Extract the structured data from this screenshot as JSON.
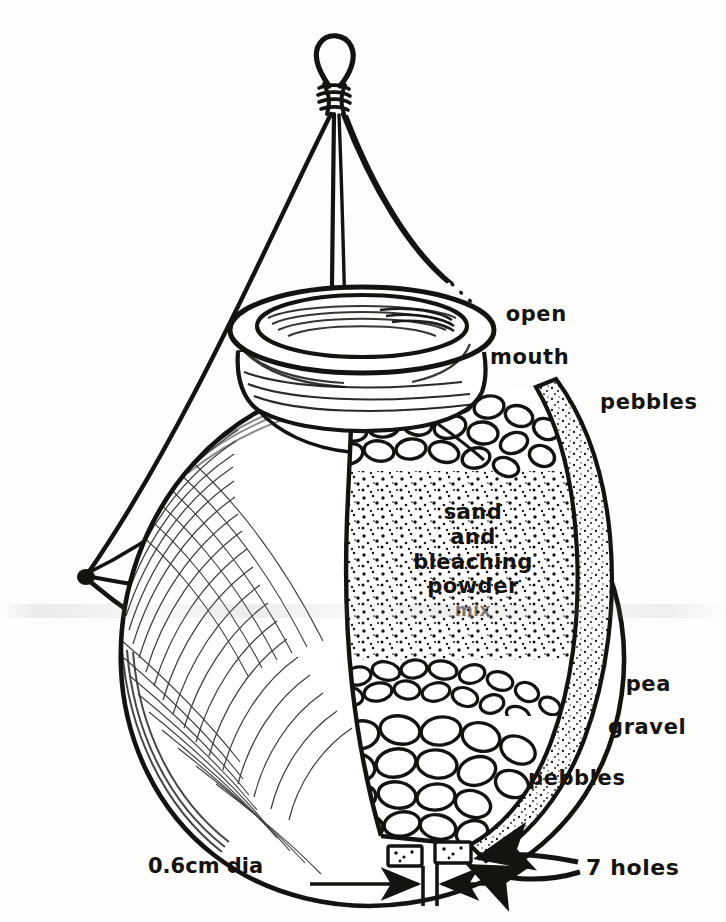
{
  "figure": {
    "ink_color": "#15130f",
    "paper_color": "#fdfdfc"
  },
  "labels": {
    "open_mouth_line1": "open",
    "open_mouth_line2": "mouth",
    "pebbles_top": "pebbles",
    "pea_gravel_line1": "pea",
    "pea_gravel_line2": "gravel",
    "pebbles_bottom": "pebbles",
    "holes": "7 holes",
    "hole_diameter": "0.6cm dia"
  },
  "fill_label": {
    "line1": "sand",
    "line2": "and",
    "line3": "bleaching",
    "line4": "powder",
    "line5": "mix"
  },
  "layers": [
    {
      "name": "pebbles-top",
      "label": "pebbles"
    },
    {
      "name": "sand-bleaching-powder-mix",
      "label": "sand and bleaching powder mix"
    },
    {
      "name": "pea-gravel",
      "label": "pea gravel"
    },
    {
      "name": "pebbles-bottom",
      "label": "pebbles"
    }
  ],
  "dimensions": {
    "hole_diameter_value": "0.6cm dia",
    "hole_count_label": "7 holes"
  }
}
